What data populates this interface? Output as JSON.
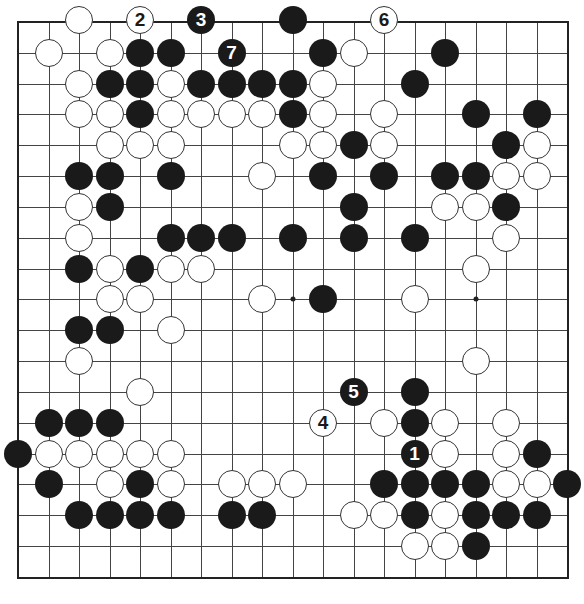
{
  "board": {
    "size": 19,
    "origin_x": 18,
    "origin_y": 22,
    "step_x": 30.5,
    "step_y": 30.83,
    "line_color": "#444444",
    "frame_color": "#222222",
    "black_color": "#1a1a1a",
    "white_color": "#ffffff",
    "hoshi": [
      [
        9,
        9
      ],
      [
        9,
        15
      ]
    ],
    "stones": [
      {
        "r": 0,
        "c": 2,
        "color": "w"
      },
      {
        "r": 0,
        "c": 4,
        "color": "w",
        "label": "2"
      },
      {
        "r": 0,
        "c": 6,
        "color": "b",
        "label": "3"
      },
      {
        "r": 0,
        "c": 9,
        "color": "b"
      },
      {
        "r": 0,
        "c": 12,
        "color": "w",
        "label": "6"
      },
      {
        "r": 1,
        "c": 1,
        "color": "w"
      },
      {
        "r": 1,
        "c": 3,
        "color": "w"
      },
      {
        "r": 1,
        "c": 4,
        "color": "b"
      },
      {
        "r": 1,
        "c": 5,
        "color": "b"
      },
      {
        "r": 1,
        "c": 7,
        "color": "b",
        "label": "7"
      },
      {
        "r": 1,
        "c": 10,
        "color": "b"
      },
      {
        "r": 1,
        "c": 11,
        "color": "w"
      },
      {
        "r": 1,
        "c": 14,
        "color": "b"
      },
      {
        "r": 2,
        "c": 2,
        "color": "w"
      },
      {
        "r": 2,
        "c": 3,
        "color": "b"
      },
      {
        "r": 2,
        "c": 4,
        "color": "b"
      },
      {
        "r": 2,
        "c": 5,
        "color": "w"
      },
      {
        "r": 2,
        "c": 6,
        "color": "b"
      },
      {
        "r": 2,
        "c": 7,
        "color": "b"
      },
      {
        "r": 2,
        "c": 8,
        "color": "b"
      },
      {
        "r": 2,
        "c": 9,
        "color": "b"
      },
      {
        "r": 2,
        "c": 10,
        "color": "w"
      },
      {
        "r": 2,
        "c": 13,
        "color": "b"
      },
      {
        "r": 3,
        "c": 2,
        "color": "w"
      },
      {
        "r": 3,
        "c": 3,
        "color": "w"
      },
      {
        "r": 3,
        "c": 4,
        "color": "b"
      },
      {
        "r": 3,
        "c": 5,
        "color": "w"
      },
      {
        "r": 3,
        "c": 6,
        "color": "w"
      },
      {
        "r": 3,
        "c": 7,
        "color": "w"
      },
      {
        "r": 3,
        "c": 8,
        "color": "w"
      },
      {
        "r": 3,
        "c": 9,
        "color": "b"
      },
      {
        "r": 3,
        "c": 10,
        "color": "w"
      },
      {
        "r": 3,
        "c": 12,
        "color": "w"
      },
      {
        "r": 3,
        "c": 15,
        "color": "b"
      },
      {
        "r": 3,
        "c": 17,
        "color": "b"
      },
      {
        "r": 4,
        "c": 3,
        "color": "w"
      },
      {
        "r": 4,
        "c": 4,
        "color": "w"
      },
      {
        "r": 4,
        "c": 5,
        "color": "w"
      },
      {
        "r": 4,
        "c": 9,
        "color": "w"
      },
      {
        "r": 4,
        "c": 10,
        "color": "w"
      },
      {
        "r": 4,
        "c": 11,
        "color": "b"
      },
      {
        "r": 4,
        "c": 12,
        "color": "w"
      },
      {
        "r": 4,
        "c": 16,
        "color": "b"
      },
      {
        "r": 4,
        "c": 17,
        "color": "w"
      },
      {
        "r": 5,
        "c": 2,
        "color": "b"
      },
      {
        "r": 5,
        "c": 3,
        "color": "b"
      },
      {
        "r": 5,
        "c": 5,
        "color": "b"
      },
      {
        "r": 5,
        "c": 8,
        "color": "w"
      },
      {
        "r": 5,
        "c": 10,
        "color": "b"
      },
      {
        "r": 5,
        "c": 12,
        "color": "b"
      },
      {
        "r": 5,
        "c": 14,
        "color": "b"
      },
      {
        "r": 5,
        "c": 15,
        "color": "b"
      },
      {
        "r": 5,
        "c": 16,
        "color": "w"
      },
      {
        "r": 5,
        "c": 17,
        "color": "w"
      },
      {
        "r": 6,
        "c": 2,
        "color": "w"
      },
      {
        "r": 6,
        "c": 3,
        "color": "b"
      },
      {
        "r": 6,
        "c": 11,
        "color": "b"
      },
      {
        "r": 6,
        "c": 14,
        "color": "w"
      },
      {
        "r": 6,
        "c": 15,
        "color": "w"
      },
      {
        "r": 6,
        "c": 16,
        "color": "b"
      },
      {
        "r": 7,
        "c": 2,
        "color": "w"
      },
      {
        "r": 7,
        "c": 5,
        "color": "b"
      },
      {
        "r": 7,
        "c": 6,
        "color": "b"
      },
      {
        "r": 7,
        "c": 7,
        "color": "b"
      },
      {
        "r": 7,
        "c": 9,
        "color": "b"
      },
      {
        "r": 7,
        "c": 11,
        "color": "b"
      },
      {
        "r": 7,
        "c": 13,
        "color": "b"
      },
      {
        "r": 7,
        "c": 16,
        "color": "w"
      },
      {
        "r": 8,
        "c": 2,
        "color": "b"
      },
      {
        "r": 8,
        "c": 3,
        "color": "w"
      },
      {
        "r": 8,
        "c": 4,
        "color": "b"
      },
      {
        "r": 8,
        "c": 5,
        "color": "w"
      },
      {
        "r": 8,
        "c": 6,
        "color": "w"
      },
      {
        "r": 8,
        "c": 15,
        "color": "w"
      },
      {
        "r": 9,
        "c": 3,
        "color": "w"
      },
      {
        "r": 9,
        "c": 4,
        "color": "w"
      },
      {
        "r": 9,
        "c": 8,
        "color": "w"
      },
      {
        "r": 9,
        "c": 10,
        "color": "b"
      },
      {
        "r": 9,
        "c": 13,
        "color": "w"
      },
      {
        "r": 10,
        "c": 2,
        "color": "b"
      },
      {
        "r": 10,
        "c": 3,
        "color": "b"
      },
      {
        "r": 10,
        "c": 5,
        "color": "w"
      },
      {
        "r": 11,
        "c": 2,
        "color": "w"
      },
      {
        "r": 11,
        "c": 15,
        "color": "w"
      },
      {
        "r": 12,
        "c": 4,
        "color": "w"
      },
      {
        "r": 12,
        "c": 11,
        "color": "b",
        "label": "5"
      },
      {
        "r": 12,
        "c": 13,
        "color": "b"
      },
      {
        "r": 13,
        "c": 1,
        "color": "b"
      },
      {
        "r": 13,
        "c": 2,
        "color": "b"
      },
      {
        "r": 13,
        "c": 3,
        "color": "b"
      },
      {
        "r": 13,
        "c": 10,
        "color": "w",
        "label": "4"
      },
      {
        "r": 13,
        "c": 12,
        "color": "w"
      },
      {
        "r": 13,
        "c": 13,
        "color": "b"
      },
      {
        "r": 13,
        "c": 14,
        "color": "w"
      },
      {
        "r": 13,
        "c": 16,
        "color": "w"
      },
      {
        "r": 14,
        "c": 0,
        "color": "b"
      },
      {
        "r": 14,
        "c": 1,
        "color": "w"
      },
      {
        "r": 14,
        "c": 2,
        "color": "w"
      },
      {
        "r": 14,
        "c": 3,
        "color": "w"
      },
      {
        "r": 14,
        "c": 4,
        "color": "w"
      },
      {
        "r": 14,
        "c": 5,
        "color": "w"
      },
      {
        "r": 14,
        "c": 13,
        "color": "b",
        "label": "1"
      },
      {
        "r": 14,
        "c": 14,
        "color": "w"
      },
      {
        "r": 14,
        "c": 16,
        "color": "w"
      },
      {
        "r": 14,
        "c": 17,
        "color": "b"
      },
      {
        "r": 15,
        "c": 1,
        "color": "b"
      },
      {
        "r": 15,
        "c": 3,
        "color": "w"
      },
      {
        "r": 15,
        "c": 4,
        "color": "b"
      },
      {
        "r": 15,
        "c": 5,
        "color": "w"
      },
      {
        "r": 15,
        "c": 7,
        "color": "w"
      },
      {
        "r": 15,
        "c": 8,
        "color": "w"
      },
      {
        "r": 15,
        "c": 9,
        "color": "w"
      },
      {
        "r": 15,
        "c": 12,
        "color": "b"
      },
      {
        "r": 15,
        "c": 13,
        "color": "b"
      },
      {
        "r": 15,
        "c": 14,
        "color": "b"
      },
      {
        "r": 15,
        "c": 15,
        "color": "b"
      },
      {
        "r": 15,
        "c": 16,
        "color": "w"
      },
      {
        "r": 15,
        "c": 17,
        "color": "w"
      },
      {
        "r": 15,
        "c": 18,
        "color": "b"
      },
      {
        "r": 16,
        "c": 2,
        "color": "b"
      },
      {
        "r": 16,
        "c": 3,
        "color": "b"
      },
      {
        "r": 16,
        "c": 4,
        "color": "b"
      },
      {
        "r": 16,
        "c": 5,
        "color": "b"
      },
      {
        "r": 16,
        "c": 7,
        "color": "b"
      },
      {
        "r": 16,
        "c": 8,
        "color": "b"
      },
      {
        "r": 16,
        "c": 11,
        "color": "w"
      },
      {
        "r": 16,
        "c": 12,
        "color": "w"
      },
      {
        "r": 16,
        "c": 13,
        "color": "b"
      },
      {
        "r": 16,
        "c": 14,
        "color": "w"
      },
      {
        "r": 16,
        "c": 15,
        "color": "b"
      },
      {
        "r": 16,
        "c": 16,
        "color": "b"
      },
      {
        "r": 16,
        "c": 17,
        "color": "b"
      },
      {
        "r": 17,
        "c": 13,
        "color": "w"
      },
      {
        "r": 17,
        "c": 14,
        "color": "w"
      },
      {
        "r": 17,
        "c": 15,
        "color": "b"
      }
    ]
  }
}
